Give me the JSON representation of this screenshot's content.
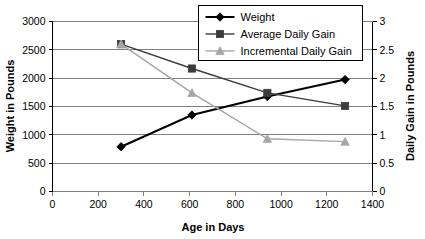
{
  "chart_data": {
    "type": "line",
    "title": "",
    "xlabel": "Age in Days",
    "ylabel": "Weight in Pounds",
    "y2label": "Daily Gain in Pounds",
    "xlim": [
      0,
      1400
    ],
    "ylim": [
      0,
      3000
    ],
    "y2lim": [
      0,
      3
    ],
    "xticks": [
      0,
      200,
      400,
      600,
      800,
      1000,
      1200,
      1400
    ],
    "xtick_labels": [
      "0",
      "200",
      "400",
      "600",
      "800",
      "1000",
      "1200",
      "1400"
    ],
    "yticks": [
      0,
      500,
      1000,
      1500,
      2000,
      2500,
      3000
    ],
    "ytick_labels": [
      "0",
      "500",
      "1000",
      "1500",
      "2000",
      "2500",
      "3000"
    ],
    "y2ticks": [
      0,
      0.5,
      1,
      1.5,
      2,
      2.5,
      3
    ],
    "y2tick_labels": [
      "0",
      "0.5",
      "1",
      "1.5",
      "2",
      "2.5",
      "3"
    ],
    "grid": true,
    "grid_axis": "y",
    "legend_position": "top-right",
    "series": [
      {
        "name": "Weight",
        "axis": "left",
        "marker": "diamond",
        "color": "#000000",
        "line_width": 2,
        "x": [
          300,
          610,
          940,
          1280
        ],
        "values": [
          790,
          1350,
          1675,
          1975
        ]
      },
      {
        "name": "Average Daily Gain",
        "axis": "right",
        "marker": "square",
        "color": "#3b3b3b",
        "line_width": 1.4,
        "x": [
          300,
          610,
          940,
          1280
        ],
        "values": [
          2.6,
          2.17,
          1.74,
          1.51
        ]
      },
      {
        "name": "Incremental Daily Gain",
        "axis": "right",
        "marker": "triangle",
        "color": "#a6a6a6",
        "line_width": 1.4,
        "x": [
          300,
          610,
          940,
          1280
        ],
        "values": [
          2.6,
          1.74,
          0.93,
          0.88
        ]
      }
    ],
    "colors": {
      "weight": "#000000",
      "average_daily_gain": "#3b3b3b",
      "incremental_daily_gain": "#a6a6a6",
      "grid": "#7f7f7f",
      "axis": "#000000",
      "background": "#ffffff"
    }
  },
  "legend": {
    "items": [
      {
        "label": "Weight"
      },
      {
        "label": "Average Daily Gain"
      },
      {
        "label": "Incremental Daily Gain"
      }
    ]
  }
}
